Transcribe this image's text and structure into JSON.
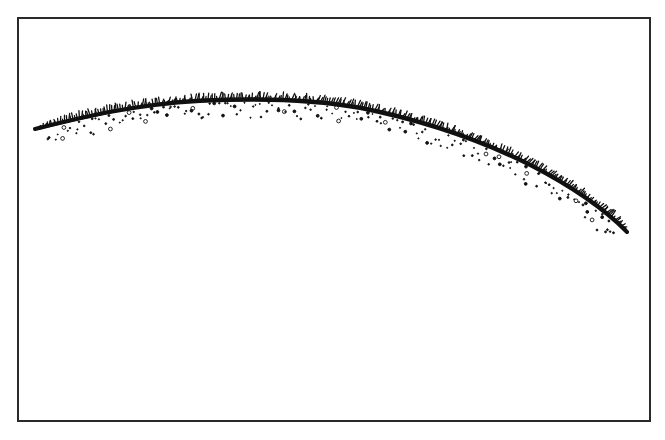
{
  "illustration": {
    "subject": "grassy hillside curve",
    "description": "Black ink line drawing of a curved ridge of grass with scattered pebbles beneath, inside a rectangular frame",
    "ink_color": "#111111",
    "frame_color": "#2a2a2a",
    "background_color": "#ffffff",
    "curve_points": [
      [
        35,
        129
      ],
      [
        100,
        113
      ],
      [
        170,
        103
      ],
      [
        260,
        100
      ],
      [
        330,
        104
      ],
      [
        400,
        118
      ],
      [
        470,
        138
      ],
      [
        530,
        165
      ],
      [
        580,
        195
      ],
      [
        627,
        232
      ]
    ]
  }
}
